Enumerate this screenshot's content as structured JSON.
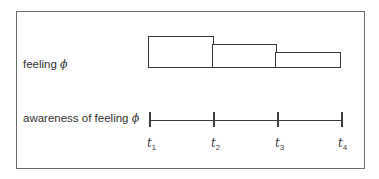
{
  "diagram": {
    "rows": [
      {
        "label": "feeling",
        "symbol": "ϕ"
      },
      {
        "label": "awareness of feeling",
        "symbol": "ϕ"
      }
    ],
    "time_labels": [
      {
        "var": "t",
        "sub": "1"
      },
      {
        "var": "t",
        "sub": "2"
      },
      {
        "var": "t",
        "sub": "3"
      },
      {
        "var": "t",
        "sub": "4"
      }
    ],
    "feeling_intensity_steps": [
      "high",
      "medium",
      "low"
    ],
    "colors": {
      "stroke": "#3a3a3a",
      "frame": "#6e6e6e",
      "text": "#333333"
    }
  }
}
